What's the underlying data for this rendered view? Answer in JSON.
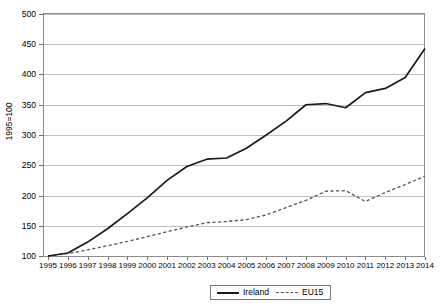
{
  "chart_data": {
    "type": "line",
    "title": "",
    "subtitle": "",
    "xlabel": "",
    "ylabel": "1995=100",
    "ylim": [
      100,
      500
    ],
    "ytick_step": 50,
    "yticks": [
      100,
      150,
      200,
      250,
      300,
      350,
      400,
      450,
      500
    ],
    "grid": true,
    "grid_axis": "y",
    "legend_position": "bottom-center",
    "x": [
      1995,
      1996,
      1997,
      1998,
      1999,
      2000,
      2001,
      2002,
      2003,
      2004,
      2005,
      2006,
      2007,
      2008,
      2009,
      2010,
      2011,
      2012,
      2013,
      2014
    ],
    "categories": [
      "1995",
      "1996",
      "1997",
      "1998",
      "1999",
      "2000",
      "2001",
      "2002",
      "2003",
      "2004",
      "2005",
      "2006",
      "2007",
      "2008",
      "2009",
      "2010",
      "2011",
      "2012",
      "2013",
      "2014"
    ],
    "series": [
      {
        "name": "Ireland",
        "style": "solid",
        "color": "#1a1a1a",
        "values": [
          100,
          105,
          123,
          145,
          170,
          196,
          225,
          248,
          260,
          262,
          278,
          300,
          323,
          350,
          352,
          345,
          370,
          377,
          395,
          443
        ]
      },
      {
        "name": "EU15",
        "style": "dashed",
        "color": "#555555",
        "values": [
          100,
          104,
          110,
          117,
          124,
          132,
          140,
          148,
          155,
          157,
          160,
          168,
          180,
          192,
          207,
          208,
          190,
          205,
          218,
          232
        ]
      }
    ]
  },
  "legend": {
    "entries": [
      {
        "label": "Ireland",
        "style": "solid"
      },
      {
        "label": "EU15",
        "style": "dashed"
      }
    ]
  },
  "axes": {
    "y_title": "1995=100",
    "y_tick_labels": [
      "500",
      "450",
      "400",
      "350",
      "300",
      "250",
      "200",
      "150",
      "100"
    ],
    "x_tick_labels": [
      "1995",
      "1996",
      "1997",
      "1998",
      "1999",
      "2000",
      "2001",
      "2002",
      "2003",
      "2004",
      "2005",
      "2006",
      "2007",
      "2008",
      "2009",
      "2010",
      "2011",
      "2012",
      "2013",
      "2014"
    ]
  },
  "colors": {
    "ireland_line": "#1a1a1a",
    "eu15_line": "#555555",
    "gridline": "#bfbfbf",
    "frame": "#8c8c8c",
    "background": "#ffffff"
  }
}
